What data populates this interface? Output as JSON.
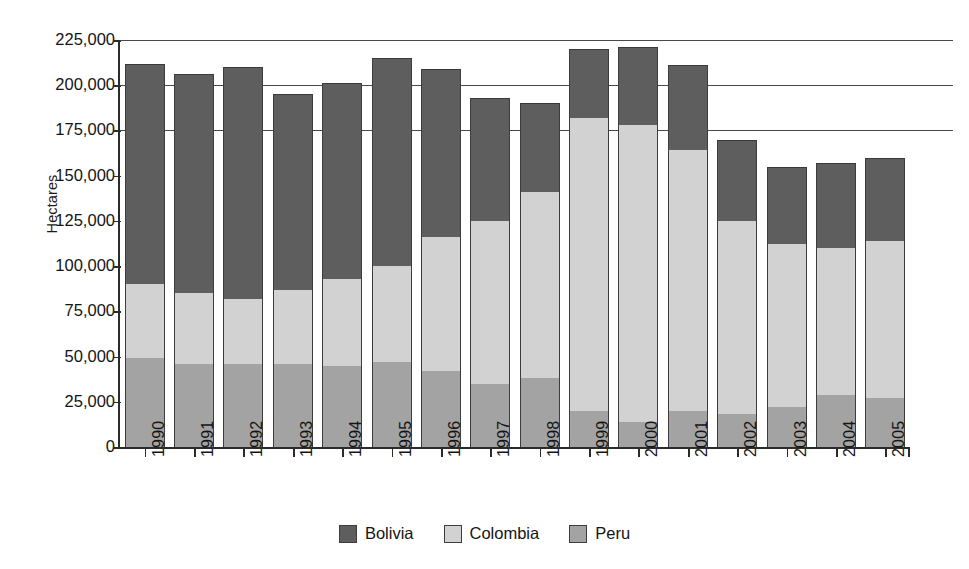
{
  "chart_data": {
    "type": "bar",
    "subtype": "stacked-vertical",
    "title": "",
    "xlabel": "",
    "ylabel": "Hectares",
    "ylim": [
      0,
      225000
    ],
    "ytick_step": 25000,
    "ytick_labels": [
      "225,000",
      "200,000",
      "175,000",
      "150,000",
      "125,000",
      "100,000",
      "75,000",
      "50,000",
      "25,000",
      "0"
    ],
    "ytick_values": [
      225000,
      200000,
      175000,
      150000,
      125000,
      100000,
      75000,
      50000,
      25000,
      0
    ],
    "grid": "horizontal-partial",
    "gridline_values": [
      225000,
      200000,
      175000
    ],
    "legend_position": "bottom-center",
    "categories": [
      "1990",
      "1991",
      "1992",
      "1993",
      "1994",
      "1995",
      "1996",
      "1997",
      "1998",
      "1999",
      "2000",
      "2001",
      "2002",
      "2003",
      "2004",
      "2005"
    ],
    "series": [
      {
        "name": "Peru",
        "color": "#a3a3a3",
        "stack_order": 0,
        "values": [
          49000,
          46000,
          46000,
          46000,
          45000,
          47000,
          42000,
          35000,
          38000,
          20000,
          14000,
          20000,
          18000,
          22000,
          29000,
          27000
        ]
      },
      {
        "name": "Colombia",
        "color": "#d2d2d2",
        "stack_order": 1,
        "values": [
          41000,
          39000,
          36000,
          41000,
          48000,
          53000,
          74000,
          90000,
          103000,
          162000,
          164000,
          144000,
          107000,
          90000,
          81000,
          87000
        ]
      },
      {
        "name": "Bolivia",
        "color": "#5e5e5e",
        "stack_order": 2,
        "values": [
          122000,
          121000,
          128000,
          108000,
          108000,
          115000,
          93000,
          68000,
          49000,
          38000,
          43000,
          47000,
          45000,
          43000,
          47000,
          46000
        ]
      }
    ],
    "totals": [
      212000,
      206000,
      210000,
      195000,
      201000,
      215000,
      209000,
      193000,
      190000,
      220000,
      221000,
      211000,
      170000,
      155000,
      157000,
      160000
    ],
    "stack_tops": {
      "peru": [
        49000,
        46000,
        46000,
        46000,
        45000,
        47000,
        42000,
        35000,
        38000,
        20000,
        14000,
        20000,
        18000,
        22000,
        29000,
        27000
      ],
      "colombia": [
        90000,
        85000,
        82000,
        87000,
        93000,
        100000,
        116000,
        125000,
        141000,
        182000,
        178000,
        164000,
        125000,
        112000,
        110000,
        114000
      ],
      "bolivia": [
        212000,
        206000,
        210000,
        195000,
        201000,
        215000,
        209000,
        193000,
        190000,
        220000,
        221000,
        211000,
        170000,
        155000,
        157000,
        160000
      ]
    }
  },
  "legend": {
    "items": [
      {
        "label": "Bolivia",
        "color": "#5e5e5e"
      },
      {
        "label": "Colombia",
        "color": "#d2d2d2"
      },
      {
        "label": "Peru",
        "color": "#a3a3a3"
      }
    ]
  },
  "axis": {
    "y_title": "Hectares"
  }
}
